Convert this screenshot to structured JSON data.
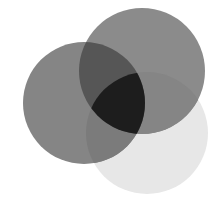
{
  "diagram": {
    "type": "venn",
    "sets": [
      {
        "id": "left",
        "cx": 84,
        "cy": 103,
        "r": 61,
        "color": "#858585"
      },
      {
        "id": "top",
        "cx": 142,
        "cy": 71,
        "r": 63,
        "color": "#8b8b8b"
      },
      {
        "id": "bottom",
        "cx": 147,
        "cy": 133,
        "r": 61,
        "color": "#e7e7e7"
      }
    ],
    "overlaps": {
      "left_top": "#565656",
      "left_bottom": "#7b7b7b",
      "top_bottom": "#858585",
      "left_top_bottom": "#1d1d1d"
    }
  }
}
